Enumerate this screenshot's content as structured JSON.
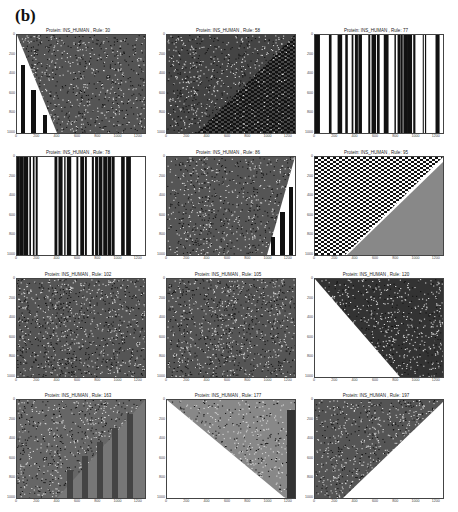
{
  "figure_label": "(b)",
  "chart_data": [
    {
      "type": "heatmap",
      "title": "Protein: INS_HUMAN , Rule: 30",
      "pattern": "random texture with black/white vertical stripes in lower-left triangle",
      "xlabel": "",
      "ylabel": "",
      "xticks": [
        "0",
        "200",
        "400",
        "600",
        "800",
        "1000",
        "1200"
      ],
      "yticks": [
        "0",
        "200",
        "400",
        "600",
        "800",
        "1000"
      ],
      "xlim": [
        0,
        1260
      ],
      "ylim": [
        1000,
        0
      ]
    },
    {
      "type": "heatmap",
      "title": "Protein: INS_HUMAN , Rule: 58",
      "pattern": "diagonal noisy bands upper-left, checkerboard lower-right triangle",
      "xticks": [
        "0",
        "200",
        "400",
        "600",
        "800",
        "1000",
        "1200"
      ],
      "yticks": [
        "0",
        "200",
        "400",
        "600",
        "800",
        "1000"
      ],
      "xlim": [
        0,
        1260
      ],
      "ylim": [
        1000,
        0
      ]
    },
    {
      "type": "heatmap",
      "title": "Protein: INS_HUMAN , Rule: 77",
      "pattern": "vertical black/white stripes",
      "xticks": [
        "0",
        "200",
        "400",
        "600",
        "800",
        "1000",
        "1200"
      ],
      "yticks": [
        "0",
        "200",
        "400",
        "600",
        "800",
        "1000"
      ],
      "xlim": [
        0,
        1260
      ],
      "ylim": [
        1000,
        0
      ]
    },
    {
      "type": "heatmap",
      "title": "Protein: INS_HUMAN , Rule: 78",
      "pattern": "vertical black/white stripes",
      "xticks": [
        "0",
        "200",
        "400",
        "600",
        "800",
        "1000",
        "1200"
      ],
      "yticks": [
        "0",
        "200",
        "400",
        "600",
        "800",
        "1000"
      ],
      "xlim": [
        0,
        1260
      ],
      "ylim": [
        1000,
        0
      ]
    },
    {
      "type": "heatmap",
      "title": "Protein: INS_HUMAN , Rule: 86",
      "pattern": "random texture with vertical stripes in lower-right triangle",
      "xticks": [
        "0",
        "200",
        "400",
        "600",
        "800",
        "1000",
        "1200"
      ],
      "yticks": [
        "0",
        "200",
        "400",
        "600",
        "800",
        "1000"
      ],
      "xlim": [
        0,
        1260
      ],
      "ylim": [
        1000,
        0
      ]
    },
    {
      "type": "heatmap",
      "title": "Protein: INS_HUMAN , Rule: 95",
      "pattern": "checkerboard upper-left, uniform gray lower-right triangle",
      "xticks": [
        "0",
        "200",
        "400",
        "600",
        "800",
        "1000",
        "1200"
      ],
      "yticks": [
        "0",
        "200",
        "400",
        "600",
        "800",
        "1000"
      ],
      "xlim": [
        0,
        1260
      ],
      "ylim": [
        1000,
        0
      ]
    },
    {
      "type": "heatmap",
      "title": "Protein: INS_HUMAN , Rule: 102",
      "pattern": "random texture",
      "xticks": [
        "0",
        "200",
        "400",
        "600",
        "800",
        "1000",
        "1200"
      ],
      "yticks": [
        "0",
        "200",
        "400",
        "600",
        "800",
        "1000"
      ],
      "xlim": [
        0,
        1260
      ],
      "ylim": [
        1000,
        0
      ]
    },
    {
      "type": "heatmap",
      "title": "Protein: INS_HUMAN , Rule: 105",
      "pattern": "random texture",
      "xticks": [
        "0",
        "200",
        "400",
        "600",
        "800",
        "1000",
        "1200"
      ],
      "yticks": [
        "0",
        "200",
        "400",
        "600",
        "800",
        "1000"
      ],
      "xlim": [
        0,
        1260
      ],
      "ylim": [
        1000,
        0
      ]
    },
    {
      "type": "heatmap",
      "title": "Protein: INS_HUMAN , Rule: 120",
      "pattern": "random texture upper-right, white lower-left triangle",
      "xticks": [
        "0",
        "200",
        "400",
        "600",
        "800",
        "1000",
        "1200"
      ],
      "yticks": [
        "0",
        "200",
        "400",
        "600",
        "800",
        "1000"
      ],
      "xlim": [
        0,
        1260
      ],
      "ylim": [
        1000,
        0
      ]
    },
    {
      "type": "heatmap",
      "title": "Protein: INS_HUMAN , Rule: 163",
      "pattern": "diagonal noisy bands upper-left, gray vertical stripes lower-right",
      "xticks": [
        "0",
        "200",
        "400",
        "600",
        "800",
        "1000",
        "1200"
      ],
      "yticks": [
        "0",
        "200",
        "400",
        "600",
        "800",
        "1000"
      ],
      "xlim": [
        0,
        1260
      ],
      "ylim": [
        1000,
        0
      ]
    },
    {
      "type": "heatmap",
      "title": "Protein: INS_HUMAN , Rule: 177",
      "pattern": "diagonal streaks upper-right, white lower-left triangle, dark band at right edge",
      "xticks": [
        "0",
        "200",
        "400",
        "600",
        "800",
        "1000",
        "1200"
      ],
      "yticks": [
        "0",
        "200",
        "400",
        "600",
        "800",
        "1000"
      ],
      "xlim": [
        0,
        1260
      ],
      "ylim": [
        1000,
        0
      ]
    },
    {
      "type": "heatmap",
      "title": "Protein: INS_HUMAN , Rule: 197",
      "pattern": "diagonal patterns upper-left, white lower-right triangle",
      "xticks": [
        "0",
        "200",
        "400",
        "600",
        "800",
        "1000",
        "1200"
      ],
      "yticks": [
        "0",
        "200",
        "400",
        "600",
        "800",
        "1000"
      ],
      "xlim": [
        0,
        1260
      ],
      "ylim": [
        1000,
        0
      ]
    }
  ]
}
